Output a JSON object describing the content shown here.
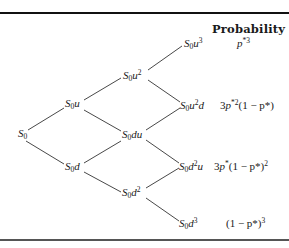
{
  "diagram": {
    "type": "binomial-tree",
    "steps": 3,
    "header": "Probability",
    "nodes": [
      {
        "id": "s0",
        "base": "S",
        "sub": "0",
        "rest": "",
        "exp": "",
        "rest2": ""
      },
      {
        "id": "s0u",
        "base": "S",
        "sub": "0",
        "rest": "u",
        "exp": "",
        "rest2": ""
      },
      {
        "id": "s0d",
        "base": "S",
        "sub": "0",
        "rest": "d",
        "exp": "",
        "rest2": ""
      },
      {
        "id": "s0u2",
        "base": "S",
        "sub": "0",
        "rest": "u",
        "exp": "2",
        "rest2": ""
      },
      {
        "id": "s0du",
        "base": "S",
        "sub": "0",
        "rest": "du",
        "exp": "",
        "rest2": ""
      },
      {
        "id": "s0d2",
        "base": "S",
        "sub": "0",
        "rest": "d",
        "exp": "2",
        "rest2": ""
      },
      {
        "id": "s0u3",
        "base": "S",
        "sub": "0",
        "rest": "u",
        "exp": "3",
        "rest2": ""
      },
      {
        "id": "s0u2d",
        "base": "S",
        "sub": "0",
        "rest": "u",
        "exp": "2",
        "rest2": "d"
      },
      {
        "id": "s0d2u",
        "base": "S",
        "sub": "0",
        "rest": "d",
        "exp": "2",
        "rest2": "u"
      },
      {
        "id": "s0d3",
        "base": "S",
        "sub": "0",
        "rest": "d",
        "exp": "3",
        "rest2": ""
      }
    ],
    "probabilities": [
      {
        "node": "S0u^3",
        "text": "p*^3",
        "pre": "",
        "p": "p",
        "star": "*",
        "exp": "3",
        "tail": "",
        "tail_exp": ""
      },
      {
        "node": "S0u^2d",
        "text": "3p*^2(1 - p*)",
        "pre": "3",
        "p": "p",
        "star": "*",
        "exp": "2",
        "tail": "(1 − p*)",
        "tail_exp": ""
      },
      {
        "node": "S0d^2u",
        "text": "3p*(1 - p*)^2",
        "pre": "3",
        "p": "p",
        "star": "*",
        "exp": "",
        "tail": "(1 − p*)",
        "tail_exp": "2"
      },
      {
        "node": "S0d^3",
        "text": "(1 - p*)^3",
        "pre": "",
        "p": "",
        "star": "",
        "exp": "",
        "tail": "(1 − p*)",
        "tail_exp": "3"
      }
    ]
  }
}
